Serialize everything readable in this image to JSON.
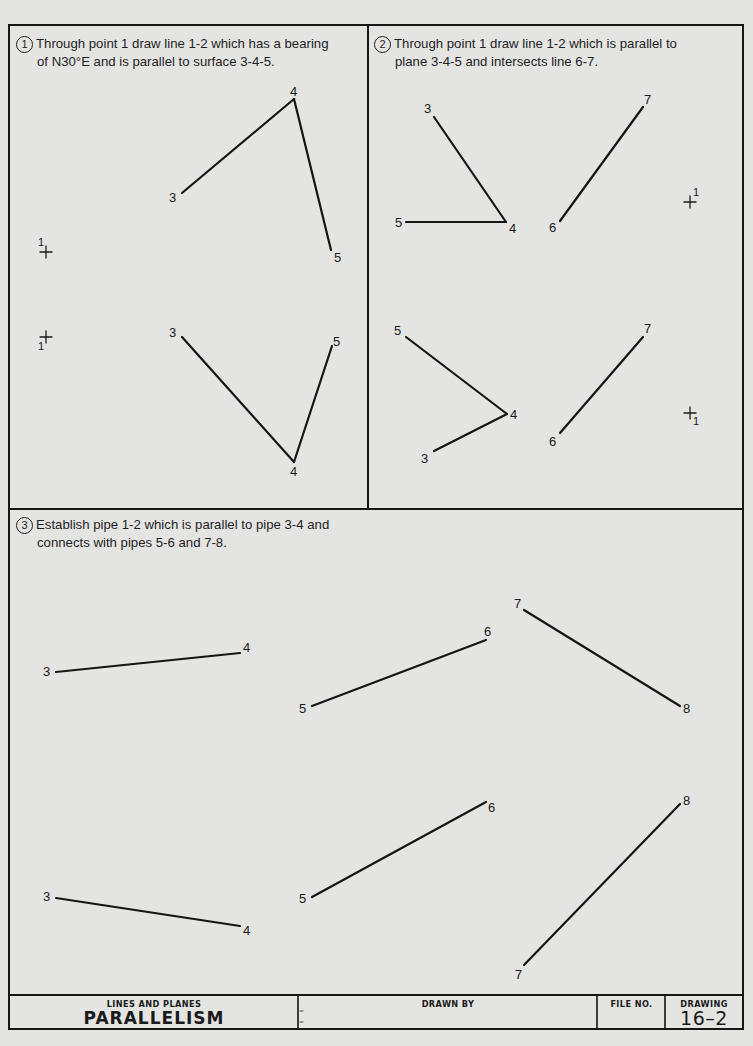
{
  "problems": [
    {
      "number": "1",
      "line1": "Through point 1 draw line 1-2 which has a bearing",
      "line2": "of N30°E and is parallel to surface 3-4-5."
    },
    {
      "number": "2",
      "line1": "Through point 1 draw line 1-2 which is parallel to",
      "line2": "plane 3-4-5 and intersects line 6-7."
    },
    {
      "number": "3",
      "line1": "Establish pipe 1-2 which is parallel to pipe 3-4 and",
      "line2": "connects with pipes 5-6 and 7-8."
    }
  ],
  "figures": {
    "p1_top": {
      "labels": {
        "p3": "3",
        "p4": "4",
        "p5": "5",
        "p1": "1"
      }
    },
    "p1_bottom": {
      "labels": {
        "p3": "3",
        "p4": "4",
        "p5": "5",
        "p1": "1"
      }
    },
    "p2_top": {
      "labels": {
        "p3": "3",
        "p4": "4",
        "p5": "5",
        "p6": "6",
        "p7": "7",
        "p1": "1"
      }
    },
    "p2_bottom": {
      "labels": {
        "p3": "3",
        "p4": "4",
        "p5": "5",
        "p6": "6",
        "p7": "7",
        "p1": "1"
      }
    },
    "p3_top": {
      "labels": {
        "p3": "3",
        "p4": "4",
        "p5": "5",
        "p6": "6",
        "p7": "7",
        "p8": "8"
      }
    },
    "p3_bottom": {
      "labels": {
        "p3": "3",
        "p4": "4",
        "p5": "5",
        "p6": "6",
        "p7": "7",
        "p8": "8"
      }
    }
  },
  "title_block": {
    "subject": "LINES AND PLANES",
    "title": "PARALLELISM",
    "drawn_by_label": "DRAWN BY",
    "file_no_label": "FILE NO.",
    "drawing_label": "DRAWING",
    "drawing_number": "16–2"
  }
}
